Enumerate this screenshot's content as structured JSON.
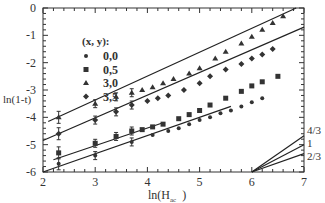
{
  "chart_data": {
    "type": "scatter",
    "title": "",
    "xlabel": "ln(H_ac)",
    "ylabel": "ln(1-t)",
    "xlim": [
      2,
      7
    ],
    "ylim": [
      -6,
      0
    ],
    "xticks": [
      2,
      3,
      4,
      5,
      6,
      7
    ],
    "yticks": [
      0,
      -1,
      -2,
      -3,
      -4,
      -5,
      -6
    ],
    "legend_title": "(x, y):",
    "legend_position": "upper-left",
    "grid": false,
    "series": [
      {
        "name": "0,0",
        "marker": "circle",
        "x": [
          2.3,
          3.0,
          3.7,
          4.1,
          4.4,
          4.6,
          4.8,
          5.0,
          5.2,
          5.4,
          5.6,
          5.8,
          6.0,
          6.2
        ],
        "y": [
          -5.7,
          -5.4,
          -4.9,
          -4.65,
          -4.5,
          -4.4,
          -4.25,
          -4.1,
          -4.0,
          -3.85,
          -3.75,
          -3.6,
          -3.45,
          -3.3
        ],
        "fit": [
          [
            2.0,
            -6.0
          ],
          [
            5.6,
            -3.6
          ]
        ]
      },
      {
        "name": "0,5",
        "marker": "square",
        "x": [
          2.3,
          3.0,
          3.4,
          3.7,
          3.9,
          4.1,
          4.3,
          4.6,
          4.8,
          5.0,
          5.2,
          5.5,
          5.8,
          6.0,
          6.2,
          6.5
        ],
        "y": [
          -5.3,
          -4.95,
          -4.7,
          -4.5,
          -4.45,
          -4.35,
          -4.25,
          -4.05,
          -3.9,
          -3.75,
          -3.55,
          -3.3,
          -3.05,
          -2.85,
          -2.7,
          -2.5
        ],
        "fit": [
          [
            2.2,
            -5.55
          ],
          [
            4.3,
            -4.2
          ]
        ]
      },
      {
        "name": "3,0",
        "marker": "triangle",
        "x": [
          2.3,
          3.0,
          3.4,
          3.7,
          3.9,
          4.1,
          4.3,
          4.5,
          4.8,
          5.0,
          5.3,
          5.5,
          5.8,
          6.0,
          6.2,
          6.4,
          6.6
        ],
        "y": [
          -4.0,
          -3.5,
          -3.25,
          -3.1,
          -3.0,
          -2.9,
          -2.75,
          -2.6,
          -2.4,
          -2.2,
          -1.85,
          -1.6,
          -1.3,
          -1.05,
          -0.8,
          -0.55,
          -0.3
        ],
        "fit": [
          [
            2.1,
            -4.15
          ],
          [
            6.85,
            0.0
          ]
        ]
      },
      {
        "name": "3,5",
        "marker": "diamond",
        "x": [
          2.3,
          3.0,
          3.4,
          3.7,
          4.0,
          4.2,
          4.4,
          4.7,
          5.0,
          5.2,
          5.5,
          5.8,
          6.0,
          6.2,
          6.4
        ],
        "y": [
          -4.6,
          -4.1,
          -3.8,
          -3.55,
          -3.4,
          -3.3,
          -3.2,
          -3.0,
          -2.75,
          -2.5,
          -2.25,
          -2.05,
          -1.85,
          -1.7,
          -1.5
        ],
        "fit": [
          [
            2.0,
            -4.85
          ],
          [
            7.0,
            -0.7
          ]
        ]
      }
    ],
    "reference_lines": [
      {
        "label": "4/3",
        "from": [
          6.0,
          -6.0
        ],
        "to": [
          7.0,
          -4.67
        ]
      },
      {
        "label": "1",
        "from": [
          6.0,
          -6.0
        ],
        "to": [
          7.0,
          -5.0
        ]
      },
      {
        "label": "2/3",
        "from": [
          6.0,
          -6.0
        ],
        "to": [
          7.0,
          -5.33
        ]
      }
    ]
  },
  "labels": {
    "ylabel": "ln(1-t)",
    "xlabel_main": "ln(H",
    "xlabel_sub": "ac",
    "xlabel_close": ")",
    "legend_title": "(x, y):"
  }
}
